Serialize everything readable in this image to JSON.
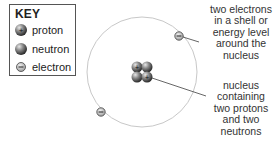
{
  "key": {
    "title": "KEY",
    "items": [
      {
        "icon": "proton-icon",
        "label": "proton"
      },
      {
        "icon": "neutron-icon",
        "label": "neutron"
      },
      {
        "icon": "electron-icon",
        "label": "electron"
      }
    ]
  },
  "captions": {
    "electrons": [
      "two electrons",
      "in a shell or",
      "energy level",
      "around the",
      "nucleus"
    ],
    "nucleus": [
      "nucleus",
      "containing",
      "two protons",
      "and two",
      "neutrons"
    ]
  },
  "atom": {
    "protons": 2,
    "neutrons": 2,
    "electrons": 2
  },
  "colors": {
    "orbit": "#c8c8c8",
    "leader": "#555555",
    "particle_dark": "#333333",
    "particle_light": "#b0b0b0"
  }
}
